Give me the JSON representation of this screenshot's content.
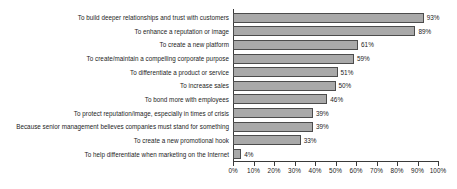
{
  "chart_data": {
    "type": "bar",
    "orientation": "horizontal",
    "title": "",
    "subtitle": "",
    "xlabel": "",
    "ylabel": "",
    "xlim": [
      0,
      100
    ],
    "xticks": [
      0,
      10,
      20,
      30,
      40,
      50,
      60,
      70,
      80,
      90,
      100
    ],
    "xtick_labels": [
      "0%",
      "10%",
      "20%",
      "30%",
      "40%",
      "50%",
      "60%",
      "70%",
      "80%",
      "90%",
      "100%"
    ],
    "grid": false,
    "legend": false,
    "value_suffix": "%",
    "bar_fill": "#a9a9a9",
    "bar_stroke": "#4c4c4c",
    "axis_color": "#3a3a3a",
    "background": "#ffffff",
    "categories": [
      "To build deeper relationships and trust with customers",
      "To enhance a reputation or image",
      "To create a new platform",
      "To create/maintain a compelling corporate purpose",
      "To differentiate a product or service",
      "To increase sales",
      "To bond more with employees",
      "To protect reputation/image, especially in times of crisis",
      "Because senior management believes companies must stand for something",
      "To create a new promotional hook",
      "To help differentiate when marketing on the Internet"
    ],
    "values": [
      93,
      89,
      61,
      59,
      51,
      50,
      46,
      39,
      39,
      33,
      4
    ],
    "data_labels": [
      "93%",
      "89%",
      "61%",
      "59%",
      "51%",
      "50%",
      "46%",
      "39%",
      "39%",
      "33%",
      "4%"
    ]
  }
}
